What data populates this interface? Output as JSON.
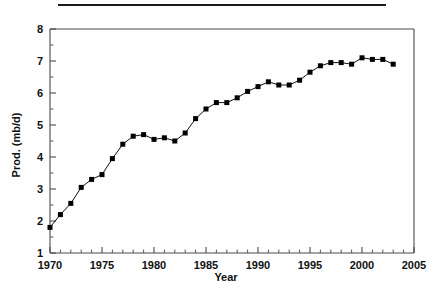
{
  "figure": {
    "top_rule": true
  },
  "chart_data": {
    "type": "line",
    "title": "",
    "xlabel": "Year",
    "ylabel": "Prod. (mb/d)",
    "xlim": [
      1970,
      2005
    ],
    "ylim": [
      1,
      8
    ],
    "x_major_ticks": [
      1970,
      1975,
      1980,
      1985,
      1990,
      1995,
      2000,
      2005
    ],
    "x_tick_labels": [
      "1970",
      "1975",
      "1980",
      "1985",
      "1990",
      "1995",
      "2000",
      "2005"
    ],
    "x_minor_step": 1,
    "y_major_ticks": [
      1,
      2,
      3,
      4,
      5,
      6,
      7,
      8
    ],
    "y_tick_labels": [
      "1",
      "2",
      "3",
      "4",
      "5",
      "6",
      "7",
      "8"
    ],
    "y_minor_step": 0.5,
    "grid": false,
    "legend": null,
    "marker": "square",
    "marker_color": "#000000",
    "line_color": "#111111",
    "x": [
      1970,
      1971,
      1972,
      1973,
      1974,
      1975,
      1976,
      1977,
      1978,
      1979,
      1980,
      1981,
      1982,
      1983,
      1984,
      1985,
      1986,
      1987,
      1988,
      1989,
      1990,
      1991,
      1992,
      1993,
      1994,
      1995,
      1996,
      1997,
      1998,
      1999,
      2000,
      2001,
      2002,
      2003
    ],
    "values": [
      1.8,
      2.2,
      2.55,
      3.05,
      3.3,
      3.45,
      3.95,
      4.4,
      4.65,
      4.7,
      4.55,
      4.6,
      4.5,
      4.75,
      5.2,
      5.5,
      5.7,
      5.7,
      5.85,
      6.05,
      6.2,
      6.35,
      6.25,
      6.25,
      6.4,
      6.65,
      6.85,
      6.95,
      6.95,
      6.9,
      7.1,
      7.05,
      7.05,
      6.9
    ]
  }
}
